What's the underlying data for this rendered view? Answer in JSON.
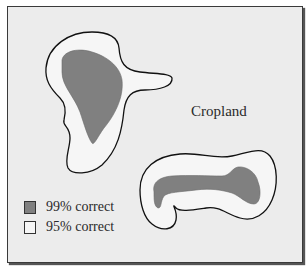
{
  "figure": {
    "region_label": "Cropland",
    "colors": {
      "background": "#ececec",
      "high_confidence_fill": "#808080",
      "low_confidence_fill": "#f6f6f6",
      "outline": "#111111"
    },
    "regions": [
      {
        "name": "Upper-left field",
        "inner": "99% correct",
        "outer": "95% correct"
      },
      {
        "name": "Lower-right field",
        "inner": "99% correct",
        "outer": "95% correct"
      }
    ]
  },
  "legend": {
    "items": [
      {
        "label": "99% correct",
        "swatch_color": "#808080"
      },
      {
        "label": "95% correct",
        "swatch_color": "#f6f6f6"
      }
    ]
  }
}
